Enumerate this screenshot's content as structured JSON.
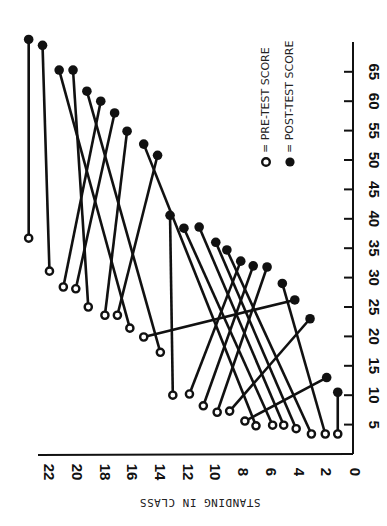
{
  "chart_data": {
    "type": "scatter",
    "subtype": "paired-dumbbell (pre vs post), figure rotated 90 degrees clockwise in print",
    "title": "",
    "xlabel": "STANDING IN CLASS",
    "ylabel": "",
    "x_ticks": [
      0,
      2,
      4,
      6,
      8,
      10,
      12,
      14,
      16,
      18,
      20,
      22
    ],
    "y_ticks": [
      5,
      10,
      15,
      20,
      25,
      30,
      35,
      40,
      45,
      50,
      55,
      60,
      65
    ],
    "xlim": [
      0,
      23.5
    ],
    "ylim": [
      0,
      68
    ],
    "legend": [
      {
        "symbol": "open-circle",
        "label": "PRE-TEST SCORE"
      },
      {
        "symbol": "filled-circle",
        "label": "POST-TEST SCORE"
      }
    ],
    "legend_position": "upper-right",
    "grid": false,
    "series": [
      {
        "name": "PRE-TEST SCORE",
        "marker": "open"
      },
      {
        "name": "POST-TEST SCORE",
        "marker": "filled"
      }
    ],
    "pairs": [
      {
        "pre": {
          "standing": 23.4,
          "score": 36.7
        },
        "post": {
          "standing": 23.4,
          "score": 70.5
        }
      },
      {
        "pre": {
          "standing": 21.9,
          "score": 31.1
        },
        "post": {
          "standing": 22.4,
          "score": 69.5
        }
      },
      {
        "pre": {
          "standing": 20.9,
          "score": 28.4
        },
        "post": {
          "standing": 18.2,
          "score": 60.0
        }
      },
      {
        "pre": {
          "standing": 20.0,
          "score": 28.1
        },
        "post": {
          "standing": 17.2,
          "score": 58.0
        }
      },
      {
        "pre": {
          "standing": 19.1,
          "score": 25.0
        },
        "post": {
          "standing": 20.2,
          "score": 65.3
        }
      },
      {
        "pre": {
          "standing": 17.9,
          "score": 23.6
        },
        "post": {
          "standing": 16.3,
          "score": 54.9
        }
      },
      {
        "pre": {
          "standing": 17.0,
          "score": 23.6
        },
        "post": {
          "standing": 14.1,
          "score": 50.8
        }
      },
      {
        "pre": {
          "standing": 16.1,
          "score": 21.4
        },
        "post": {
          "standing": 21.2,
          "score": 65.3
        }
      },
      {
        "pre": {
          "standing": 15.1,
          "score": 19.9
        },
        "post": {
          "standing": 4.2,
          "score": 26.2
        }
      },
      {
        "pre": {
          "standing": 13.9,
          "score": 17.3
        },
        "post": {
          "standing": 19.2,
          "score": 61.7
        }
      },
      {
        "pre": {
          "standing": 13.0,
          "score": 10.0
        },
        "post": {
          "standing": 13.2,
          "score": 40.6
        }
      },
      {
        "pre": {
          "standing": 11.8,
          "score": 10.2
        },
        "post": {
          "standing": 8.1,
          "score": 32.8
        }
      },
      {
        "pre": {
          "standing": 10.8,
          "score": 8.2
        },
        "post": {
          "standing": 7.2,
          "score": 32.0
        }
      },
      {
        "pre": {
          "standing": 9.8,
          "score": 7.1
        },
        "post": {
          "standing": 6.2,
          "score": 31.8
        }
      },
      {
        "pre": {
          "standing": 8.9,
          "score": 7.3
        },
        "post": {
          "standing": 3.1,
          "score": 23.0
        }
      },
      {
        "pre": {
          "standing": 7.8,
          "score": 5.6
        },
        "post": {
          "standing": 1.9,
          "score": 13.0
        }
      },
      {
        "pre": {
          "standing": 7.0,
          "score": 4.8
        },
        "post": {
          "standing": 15.1,
          "score": 52.7
        }
      },
      {
        "pre": {
          "standing": 5.8,
          "score": 4.9
        },
        "post": {
          "standing": 12.2,
          "score": 38.4
        }
      },
      {
        "pre": {
          "standing": 5.0,
          "score": 4.9
        },
        "post": {
          "standing": 11.1,
          "score": 38.6
        }
      },
      {
        "pre": {
          "standing": 4.1,
          "score": 4.3
        },
        "post": {
          "standing": 9.9,
          "score": 36.0
        }
      },
      {
        "pre": {
          "standing": 3.0,
          "score": 3.4
        },
        "post": {
          "standing": 9.1,
          "score": 34.7
        }
      },
      {
        "pre": {
          "standing": 2.0,
          "score": 3.4
        },
        "post": {
          "standing": 5.1,
          "score": 29.0
        }
      },
      {
        "pre": {
          "standing": 1.1,
          "score": 3.4
        },
        "post": {
          "standing": 1.1,
          "score": 10.5
        }
      }
    ]
  },
  "layout": {
    "x0_px": 353,
    "x_px_per_unit": 13.86,
    "y0_px": 454,
    "y_px_per_unit": 5.88
  }
}
